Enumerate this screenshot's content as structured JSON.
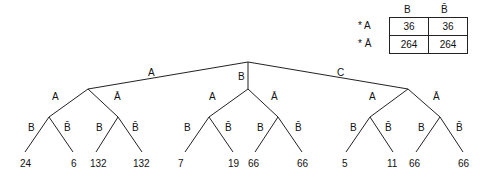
{
  "table": {
    "col_headers": [
      "B",
      "B̄"
    ],
    "row_headers": [
      "* A",
      "* Ā"
    ],
    "rows": [
      [
        "36",
        "36"
      ],
      [
        "264",
        "264"
      ]
    ]
  },
  "tree": {
    "root_edges": [
      "A",
      "B",
      "C"
    ],
    "second_level": [
      "A",
      "Ā"
    ],
    "third_level": [
      "B",
      "B̄"
    ],
    "leaves": [
      "24",
      "6",
      "132",
      "132",
      "7",
      "19",
      "66",
      "66",
      "5",
      "11",
      "66",
      "66"
    ]
  }
}
